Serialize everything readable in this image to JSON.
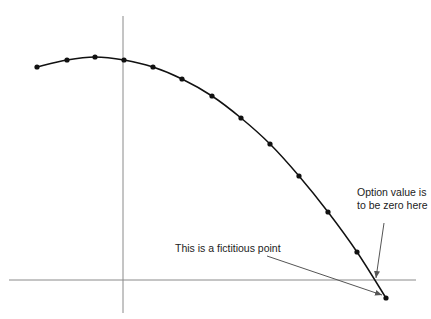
{
  "chart_data": {
    "type": "line",
    "title": "",
    "xlabel": "",
    "ylabel": "",
    "grid": false,
    "axes": {
      "x_axis_y_px": 280,
      "y_axis_x_px": 123
    },
    "series": [
      {
        "name": "option value curve",
        "points_px": [
          [
            37,
            67
          ],
          [
            67,
            60
          ],
          [
            95,
            57
          ],
          [
            124,
            60
          ],
          [
            153,
            67
          ],
          [
            182,
            79
          ],
          [
            212,
            96
          ],
          [
            241,
            118
          ],
          [
            270,
            144
          ],
          [
            299,
            176
          ],
          [
            328,
            212
          ],
          [
            357,
            252
          ],
          [
            386,
            298
          ]
        ],
        "markers": true
      }
    ],
    "annotations": [
      {
        "text_lines": [
          "Option value is",
          "to be zero here"
        ],
        "arrow_from": [
          384,
          223
        ],
        "arrow_to": [
          376,
          279
        ]
      },
      {
        "text_lines": [
          "This is a fictitious point"
        ],
        "arrow_from": [
          267,
          256
        ],
        "arrow_to": [
          384,
          296
        ]
      }
    ]
  },
  "labels": {
    "option_zero_line1": "Option value is",
    "option_zero_line2": "to be zero here",
    "fictitious_point": "This is a fictitious point"
  },
  "colors": {
    "curve": "#111111",
    "axis": "#888888",
    "arrow": "#555555"
  }
}
